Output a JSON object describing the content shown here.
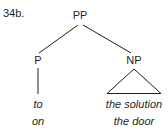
{
  "figure": {
    "example_number": "34b.",
    "line_color": "#231f20",
    "text_color": "#231f20",
    "background_color": "#ffffff"
  },
  "tree": {
    "root": {
      "label": "PP"
    },
    "nodes": [
      {
        "id": "pp",
        "label": "PP"
      },
      {
        "id": "p",
        "label": "P"
      },
      {
        "id": "np",
        "label": "NP"
      }
    ],
    "terminals": {
      "p_words": [
        "to",
        "on"
      ],
      "np_words": [
        "the solution",
        "the door"
      ]
    }
  }
}
